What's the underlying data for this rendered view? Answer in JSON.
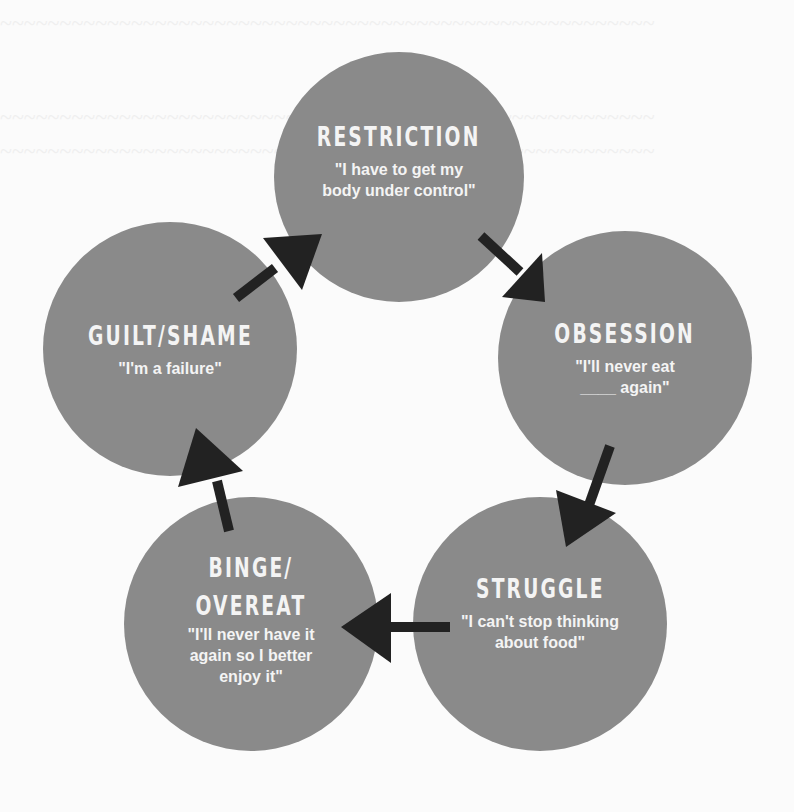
{
  "diagram": {
    "type": "cycle",
    "colors": {
      "node_fill": "#8a8a8a",
      "text": "#f4f4f4",
      "arrow": "#222222",
      "background": "#fbfbfb"
    },
    "nodes": [
      {
        "id": "restriction",
        "title": "RESTRICTION",
        "quote": "\"I have to get my\nbody under control\""
      },
      {
        "id": "obsession",
        "title": "OBSESSION",
        "quote": "\"I'll never eat\n____ again\""
      },
      {
        "id": "struggle",
        "title": "STRUGGLE",
        "quote": "\"I can't stop thinking\nabout food\""
      },
      {
        "id": "binge",
        "title": "BINGE/\nOVEREAT",
        "title_line1": "BINGE/",
        "title_line2": "OVEREAT",
        "quote": "\"I'll never have it\nagain so I better\nenjoy it\""
      },
      {
        "id": "guilt",
        "title": "GUILT/SHAME",
        "quote": "\"I'm a failure\""
      }
    ],
    "edges": [
      {
        "from": "restriction",
        "to": "obsession"
      },
      {
        "from": "obsession",
        "to": "struggle"
      },
      {
        "from": "struggle",
        "to": "binge"
      },
      {
        "from": "binge",
        "to": "guilt"
      },
      {
        "from": "guilt",
        "to": "restriction"
      }
    ]
  }
}
